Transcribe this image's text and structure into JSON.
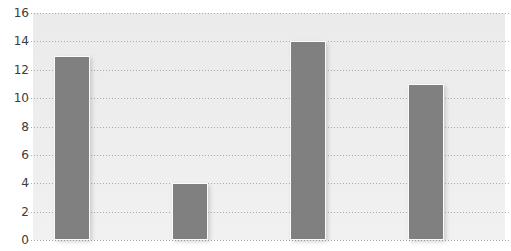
{
  "chart_data": {
    "type": "bar",
    "title": "",
    "xlabel": "",
    "ylabel": "",
    "categories": [
      "",
      "",
      "",
      ""
    ],
    "values": [
      13,
      4,
      14,
      11
    ],
    "ylim": [
      0,
      16
    ],
    "yticks": [
      0,
      2,
      4,
      6,
      8,
      10,
      12,
      14,
      16
    ],
    "ytick_labels": [
      "0",
      "2",
      "4",
      "6",
      "8",
      "10",
      "12",
      "14",
      "16"
    ],
    "xtick_labels": [],
    "grid": true,
    "grid_axis": "y",
    "grid_style": "dotted",
    "legend": false,
    "legend_position": "none",
    "series": [
      {
        "name": "",
        "values": [
          13,
          4,
          14,
          11
        ],
        "color": "#808080"
      }
    ],
    "annotations": []
  },
  "style": {
    "bar_color": "#808080",
    "bar_edge_color": "#fbfbfb",
    "plot_background": "#ececec",
    "figure_background": "#ffffff",
    "gridline_color": "#9e9e9e",
    "tick_label_color": "#3b3b3b"
  },
  "title_fragment": {
    "text": "·"
  }
}
